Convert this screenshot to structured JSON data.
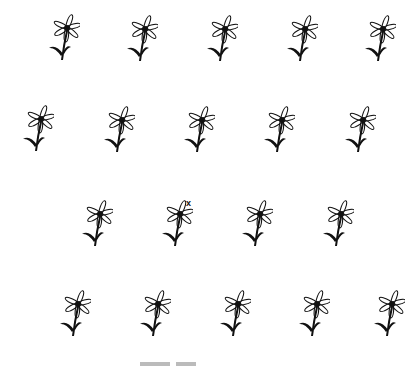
{
  "flowers": [
    {
      "x": 40,
      "y": 14
    },
    {
      "x": 118,
      "y": 15
    },
    {
      "x": 198,
      "y": 15
    },
    {
      "x": 278,
      "y": 15
    },
    {
      "x": 356,
      "y": 15
    },
    {
      "x": 14,
      "y": 105
    },
    {
      "x": 95,
      "y": 106
    },
    {
      "x": 175,
      "y": 106
    },
    {
      "x": 255,
      "y": 106
    },
    {
      "x": 336,
      "y": 106
    },
    {
      "x": 73,
      "y": 200
    },
    {
      "x": 153,
      "y": 200
    },
    {
      "x": 233,
      "y": 200
    },
    {
      "x": 314,
      "y": 200
    },
    {
      "x": 51,
      "y": 290
    },
    {
      "x": 131,
      "y": 290
    },
    {
      "x": 211,
      "y": 290
    },
    {
      "x": 290,
      "y": 290
    },
    {
      "x": 365,
      "y": 290
    }
  ],
  "marker": {
    "symbol": "x",
    "x": 186,
    "y": 199
  }
}
